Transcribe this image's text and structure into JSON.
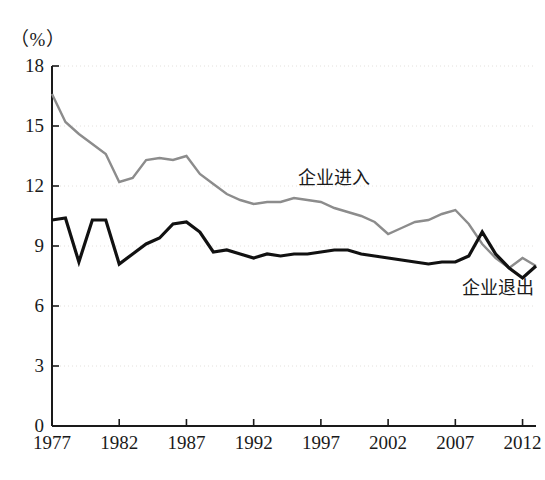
{
  "chart_data": {
    "type": "line",
    "title": "",
    "subtitle": "",
    "unit_label": "（%）",
    "xlabel": "",
    "ylabel": "",
    "xlim": [
      1977,
      2013
    ],
    "ylim": [
      0,
      18
    ],
    "ytick_labels": [
      "0",
      "3",
      "6",
      "9",
      "12",
      "15",
      "18"
    ],
    "ytick_values": [
      0,
      3,
      6,
      9,
      12,
      15,
      18
    ],
    "xtick_labels": [
      "1977",
      "1982",
      "1987",
      "1992",
      "1997",
      "2002",
      "2007",
      "2012"
    ],
    "xtick_values": [
      1977,
      1982,
      1987,
      1992,
      1997,
      2002,
      2007,
      2012
    ],
    "grid": "horizontal-dotted-faint",
    "legend_position": "inline-annotation",
    "x": [
      1977,
      1978,
      1979,
      1980,
      1981,
      1982,
      1983,
      1984,
      1985,
      1986,
      1987,
      1988,
      1989,
      1990,
      1991,
      1992,
      1993,
      1994,
      1995,
      1996,
      1997,
      1998,
      1999,
      2000,
      2001,
      2002,
      2003,
      2004,
      2005,
      2006,
      2007,
      2008,
      2009,
      2010,
      2011,
      2012,
      2013
    ],
    "series": [
      {
        "name": "企业进入",
        "color": "#8c8c8c",
        "label_x": 1995.3,
        "label_y": 12.6,
        "values": [
          16.6,
          15.2,
          14.6,
          14.1,
          13.6,
          12.2,
          12.4,
          13.3,
          13.4,
          13.3,
          13.5,
          12.6,
          12.1,
          11.6,
          11.3,
          11.1,
          11.2,
          11.2,
          11.4,
          11.3,
          11.2,
          10.9,
          10.7,
          10.5,
          10.2,
          9.6,
          9.9,
          10.2,
          10.3,
          10.6,
          10.8,
          10.1,
          9.1,
          8.4,
          7.9,
          8.4,
          8.0
        ]
      },
      {
        "name": "企业退出",
        "color": "#111111",
        "label_x": 2007.5,
        "label_y": 7.1,
        "values": [
          10.3,
          10.4,
          8.2,
          10.3,
          10.3,
          8.1,
          8.6,
          9.1,
          9.4,
          10.1,
          10.2,
          9.7,
          8.7,
          8.8,
          8.6,
          8.4,
          8.6,
          8.5,
          8.6,
          8.6,
          8.7,
          8.8,
          8.8,
          8.6,
          8.5,
          8.4,
          8.3,
          8.2,
          8.1,
          8.2,
          8.2,
          8.5,
          9.7,
          8.6,
          7.9,
          7.4,
          8.0
        ]
      }
    ]
  },
  "axes": {
    "unit_text": "（%）"
  }
}
